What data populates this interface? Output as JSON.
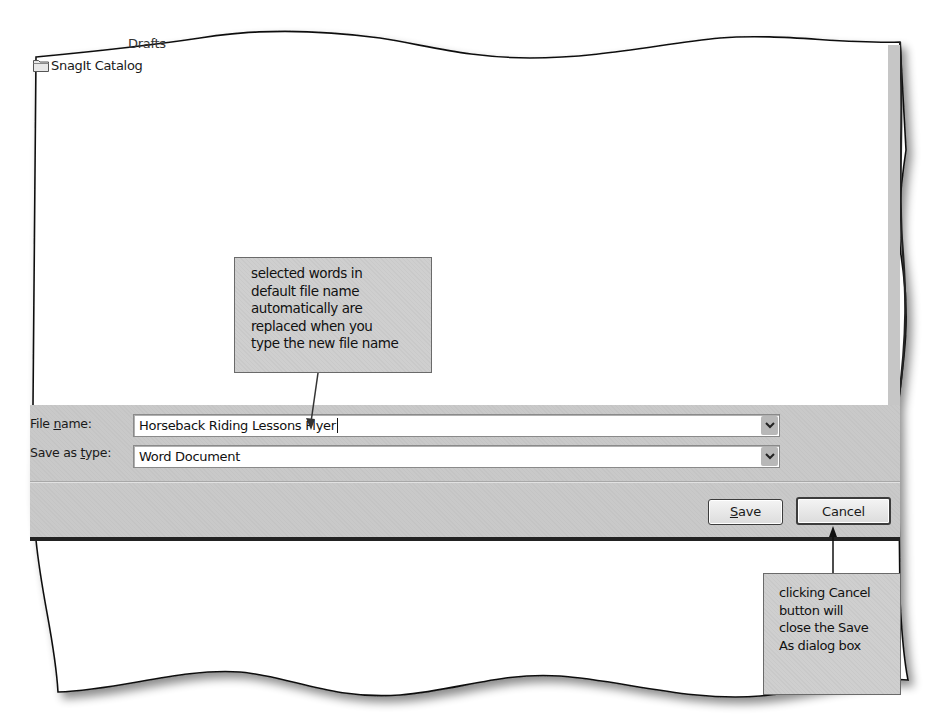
{
  "dialog": {
    "title": "Save As",
    "file_list": {
      "items": [
        {
          "label": "Drafts",
          "icon": "folder-icon",
          "partially_visible": true
        },
        {
          "label": "SnagIt Catalog",
          "icon": "folder-icon"
        }
      ]
    },
    "file_name": {
      "label_prefix": "File ",
      "label_accel": "n",
      "label_suffix": "ame:",
      "value": "Horseback Riding Lessons Flyer"
    },
    "save_as_type": {
      "label_prefix": "Save as ",
      "label_accel": "t",
      "label_suffix": "ype:",
      "value": "Word Document"
    },
    "buttons": {
      "save_accel": "S",
      "save_rest": "ave",
      "cancel": "Cancel"
    }
  },
  "callouts": [
    {
      "lines": [
        "selected words in",
        "default file name",
        "automatically are",
        "replaced when you",
        "type the new file name"
      ],
      "points_to": "file-name-input"
    },
    {
      "lines": [
        "clicking Cancel",
        "button will",
        "close the Save",
        "As dialog box"
      ],
      "points_to": "cancel-button"
    }
  ],
  "colors": {
    "panel_gray": "#c9c9c9",
    "callout_gray": "#cfcfcf",
    "border_dark": "#222222"
  }
}
